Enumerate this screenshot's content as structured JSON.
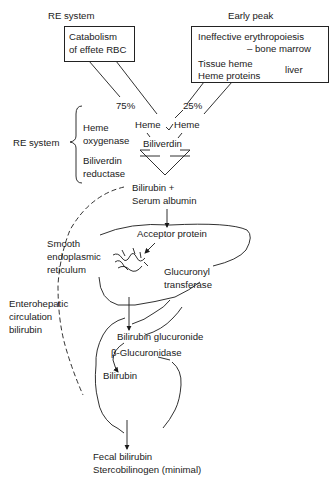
{
  "headers": {
    "re_system": "RE system",
    "early_peak": "Early peak"
  },
  "boxes": {
    "catabolism": {
      "line1": "Catabolism",
      "line2": "of effete RBC"
    },
    "early_sources": {
      "line1": "Ineffective erythropoiesis",
      "line2": "– bone marrow",
      "line3": "Tissue heme",
      "line4": "Heme proteins",
      "bracket_label": "liver"
    }
  },
  "percentages": {
    "left": "75%",
    "right": "25%"
  },
  "heme": {
    "left": "Heme",
    "right": "Heme"
  },
  "re_system_side": {
    "label": "RE system",
    "enzyme1_line1": "Heme",
    "enzyme1_line2": "oxygenase",
    "enzyme2_line1": "Biliverdin",
    "enzyme2_line2": "reductase"
  },
  "biliverdin": "Biliverdin",
  "bilirubin_albumin": {
    "line1": "Bilirubin +",
    "line2": "Serum albumin"
  },
  "liver": {
    "acceptor_protein": "Acceptor protein",
    "ser_line1": "Smooth",
    "ser_line2": "endoplasmic",
    "ser_line3": "reticulum",
    "enzyme_line1": "Glucuronyl",
    "enzyme_line2": "transferase"
  },
  "enterohepatic": {
    "line1": "Enterohepatic",
    "line2": "circulation",
    "line3": "bilirubin"
  },
  "intestine": {
    "bilirubin_glucuronide": "Bilirubin glucuronide",
    "beta_glucuronidase": "β-Glucuronidase",
    "bilirubin": "Bilirubin"
  },
  "output": {
    "line1": "Fecal bilirubin",
    "line2": "Stercobilinogen (minimal)"
  }
}
